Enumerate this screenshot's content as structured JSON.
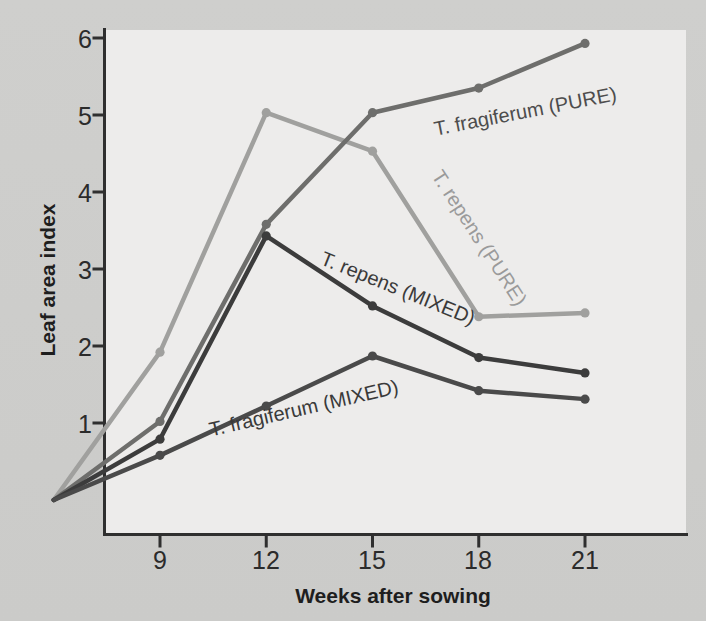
{
  "chart_data": {
    "type": "line",
    "title": "",
    "xlabel": "Weeks after sowing",
    "ylabel": "Leaf area index",
    "x": [
      6,
      9,
      12,
      15,
      18,
      21
    ],
    "xticks": [
      9,
      12,
      15,
      18,
      21
    ],
    "yticks": [
      1,
      2,
      3,
      4,
      5,
      6
    ],
    "xlim": [
      6,
      21
    ],
    "ylim": [
      0,
      6.35
    ],
    "grid": false,
    "legend": "inline-labels",
    "series": [
      {
        "name": "T. repens (PURE)",
        "label": "T. repens (PURE)",
        "color": "#a0a09e",
        "values": [
          0,
          1.92,
          5.03,
          4.53,
          2.38,
          2.43
        ]
      },
      {
        "name": "T. fragiferum (PURE)",
        "label": "T. fragiferum (PURE)",
        "color": "#6e6e6c",
        "values": [
          0,
          1.02,
          3.58,
          5.03,
          5.35,
          5.93
        ]
      },
      {
        "name": "T. repens (MIXED)",
        "label": "T. repens (MIXED)",
        "color": "#3c3c3c",
        "values": [
          0,
          0.79,
          3.43,
          2.52,
          1.85,
          1.65
        ]
      },
      {
        "name": "T. fragiferum (MIXED)",
        "label": "T. fragiferum (MIXED)",
        "color": "#4a4a4a",
        "values": [
          0,
          0.58,
          1.22,
          1.87,
          1.42,
          1.31
        ]
      }
    ]
  },
  "axis": {
    "y_tick_labels": [
      "6",
      "5",
      "4",
      "3",
      "2",
      "1"
    ],
    "x_tick_labels": [
      "9",
      "12",
      "15",
      "18",
      "21"
    ],
    "y_title": "Leaf area index",
    "x_title": "Weeks after sowing"
  },
  "labels": {
    "frag_pure": "T. fragiferum (PURE)",
    "rep_pure": "T. repens (PURE)",
    "rep_mixed": "T. repens (MIXED)",
    "frag_mixed": "T. fragiferum (MIXED)"
  },
  "colors": {
    "panel_bg": "#edeceb",
    "page_bg": "#c9c9c7",
    "axis": "#2f2f2f",
    "rep_pure": "#a0a09e",
    "frag_pure": "#6e6e6c",
    "rep_mixed": "#3c3c3c",
    "frag_mixed": "#4a4a4a"
  }
}
